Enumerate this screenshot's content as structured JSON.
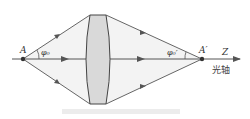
{
  "diagram": {
    "title": "",
    "labels": {
      "object_point": "A",
      "image_point": "A′",
      "object_angle": "φ₀",
      "image_angle": "φ₀′",
      "axis_name": "Z",
      "axis_caption": "光轴"
    },
    "colors": {
      "line": "#555555",
      "lens_fill": "#d9d9d9",
      "cone_fill": "#f2f2f2",
      "point": "#333333"
    }
  }
}
